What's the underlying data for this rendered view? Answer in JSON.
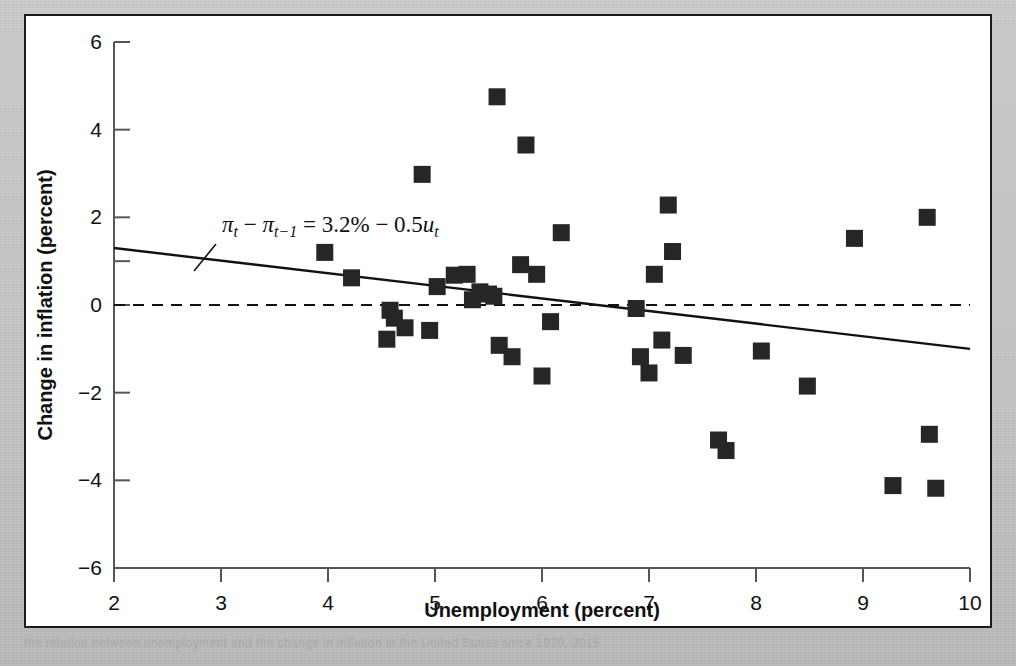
{
  "figure": {
    "caption_partial": "the relation between unemployment and the change in inflation in the United States since 1970, 2015"
  },
  "chart_data": {
    "type": "scatter",
    "title": "",
    "xlabel": "Unemployment (percent)",
    "ylabel": "Change in inflation (percent)",
    "xlim": [
      2,
      10
    ],
    "ylim": [
      -6,
      6
    ],
    "xticks": [
      2,
      3,
      4,
      5,
      6,
      7,
      8,
      9,
      10
    ],
    "xtick_labels": [
      "2",
      "3",
      "4",
      "5",
      "6",
      "7",
      "8",
      "9",
      "10"
    ],
    "yticks": [
      -6,
      -4,
      -2,
      0,
      2,
      4,
      6
    ],
    "ytick_labels": [
      "-6",
      "-4",
      "-2",
      "0",
      "2",
      "4",
      "6"
    ],
    "grid": false,
    "legend": null,
    "marker": "square",
    "marker_color": "#262626",
    "points": [
      {
        "x": 3.97,
        "y": 1.2
      },
      {
        "x": 4.22,
        "y": 0.62
      },
      {
        "x": 4.55,
        "y": -0.78
      },
      {
        "x": 4.58,
        "y": -0.12
      },
      {
        "x": 4.62,
        "y": -0.3
      },
      {
        "x": 4.72,
        "y": -0.52
      },
      {
        "x": 4.88,
        "y": 2.98
      },
      {
        "x": 4.95,
        "y": -0.58
      },
      {
        "x": 5.02,
        "y": 0.42
      },
      {
        "x": 5.18,
        "y": 0.68
      },
      {
        "x": 5.3,
        "y": 0.7
      },
      {
        "x": 5.35,
        "y": 0.12
      },
      {
        "x": 5.42,
        "y": 0.3
      },
      {
        "x": 5.5,
        "y": 0.25
      },
      {
        "x": 5.55,
        "y": 0.2
      },
      {
        "x": 5.58,
        "y": 4.75
      },
      {
        "x": 5.6,
        "y": -0.92
      },
      {
        "x": 5.72,
        "y": -1.18
      },
      {
        "x": 5.8,
        "y": 0.92
      },
      {
        "x": 5.85,
        "y": 3.65
      },
      {
        "x": 5.95,
        "y": 0.7
      },
      {
        "x": 6.0,
        "y": -1.62
      },
      {
        "x": 6.08,
        "y": -0.38
      },
      {
        "x": 6.18,
        "y": 1.65
      },
      {
        "x": 6.88,
        "y": -0.08
      },
      {
        "x": 6.92,
        "y": -1.18
      },
      {
        "x": 7.0,
        "y": -1.55
      },
      {
        "x": 7.05,
        "y": 0.7
      },
      {
        "x": 7.12,
        "y": -0.8
      },
      {
        "x": 7.18,
        "y": 2.28
      },
      {
        "x": 7.22,
        "y": 1.22
      },
      {
        "x": 7.32,
        "y": -1.15
      },
      {
        "x": 7.65,
        "y": -3.08
      },
      {
        "x": 7.72,
        "y": -3.32
      },
      {
        "x": 8.05,
        "y": -1.05
      },
      {
        "x": 8.48,
        "y": -1.85
      },
      {
        "x": 8.92,
        "y": 1.52
      },
      {
        "x": 9.28,
        "y": -4.12
      },
      {
        "x": 9.6,
        "y": 2.0
      },
      {
        "x": 9.62,
        "y": -2.95
      },
      {
        "x": 9.68,
        "y": -4.18
      }
    ],
    "fit_line": {
      "label": "pi_t - pi_t-1 = 3.2% - 0.5 u_t",
      "intercept": 3.2,
      "slope": -0.5,
      "x_start": 2,
      "y_start": 1.3,
      "x_end": 10,
      "y_end": -1.0
    },
    "reference_line": {
      "y": 0,
      "style": "dashed"
    },
    "annotation": {
      "pi_t": "π",
      "sub_t": "t",
      "minus": "−",
      "pi_t1": "π",
      "sub_t1": "t−1",
      "equals": "=",
      "intercept_text": "3.2%",
      "minus2": "−",
      "slope_text": "0.5",
      "u_var": "u",
      "u_sub": "t"
    }
  }
}
